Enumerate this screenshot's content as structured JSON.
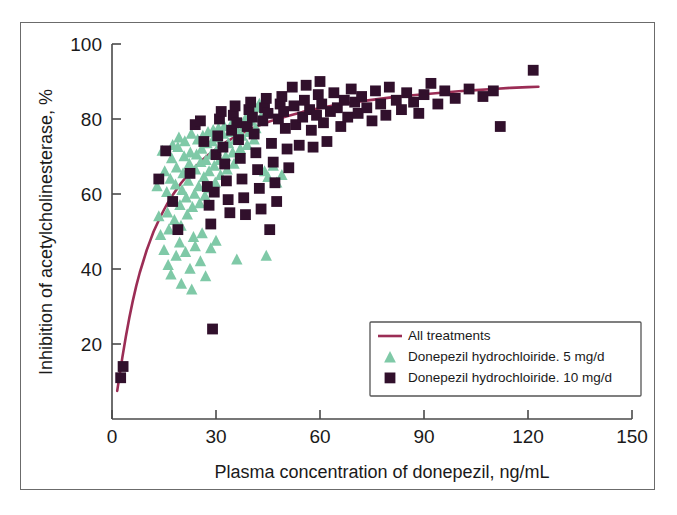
{
  "figure": {
    "background_color": "#ffffff",
    "frame_color": "#6b6b6b"
  },
  "chart_data": {
    "type": "scatter",
    "title": "",
    "subtitle": "",
    "xlabel": "Plasma concentration of donepezil, ng/mL",
    "ylabel": "Inhibition of acetylcholinesterase, %",
    "xlim": [
      0,
      150
    ],
    "ylim": [
      0,
      100
    ],
    "xticks": [
      0,
      30,
      60,
      90,
      120,
      150
    ],
    "yticks": [
      20,
      40,
      60,
      80,
      100
    ],
    "xtick_labels": [
      "0",
      "30",
      "60",
      "90",
      "120",
      "150"
    ],
    "ytick_labels": [
      "20",
      "40",
      "60",
      "80",
      "100"
    ],
    "grid": false,
    "legend_position": "lower-right",
    "legend": [
      {
        "label": "All treatments",
        "marker": "line",
        "color": "#9b2d55"
      },
      {
        "label": "Donepezil hydrochloiride. 5 mg/d",
        "marker": "triangle",
        "color": "#7fc9a7"
      },
      {
        "label": "Donepezil hydrochloiride. 10 mg/d",
        "marker": "square",
        "color": "#31102c"
      }
    ],
    "series": [
      {
        "name": "Donepezil hydrochloiride. 5 mg/d",
        "marker": "triangle",
        "color": "#7fc9a7",
        "points": [
          [
            14.5,
            71.5
          ],
          [
            15.2,
            66.0
          ],
          [
            15.8,
            60.5
          ],
          [
            16.0,
            55.0
          ],
          [
            16.4,
            50.5
          ],
          [
            16.8,
            64.0
          ],
          [
            17.2,
            69.5
          ],
          [
            17.5,
            73.0
          ],
          [
            17.8,
            58.0
          ],
          [
            18.0,
            53.0
          ],
          [
            18.3,
            62.5
          ],
          [
            18.6,
            67.0
          ],
          [
            19.0,
            72.5
          ],
          [
            19.3,
            75.0
          ],
          [
            19.6,
            57.0
          ],
          [
            19.9,
            51.5
          ],
          [
            20.2,
            61.0
          ],
          [
            20.5,
            65.5
          ],
          [
            20.8,
            70.0
          ],
          [
            21.0,
            74.0
          ],
          [
            21.4,
            59.0
          ],
          [
            21.7,
            54.5
          ],
          [
            22.0,
            63.5
          ],
          [
            22.3,
            68.0
          ],
          [
            22.6,
            71.0
          ],
          [
            22.9,
            76.0
          ],
          [
            23.2,
            56.5
          ],
          [
            23.5,
            48.5
          ],
          [
            23.8,
            60.0
          ],
          [
            24.1,
            66.5
          ],
          [
            24.4,
            70.5
          ],
          [
            24.7,
            74.5
          ],
          [
            25.0,
            62.0
          ],
          [
            25.3,
            57.5
          ],
          [
            25.6,
            68.5
          ],
          [
            25.9,
            72.0
          ],
          [
            26.2,
            75.5
          ],
          [
            26.5,
            64.5
          ],
          [
            26.8,
            59.5
          ],
          [
            27.1,
            69.0
          ],
          [
            27.4,
            73.5
          ],
          [
            27.7,
            76.5
          ],
          [
            28.0,
            66.0
          ],
          [
            28.3,
            61.5
          ],
          [
            28.6,
            70.5
          ],
          [
            28.9,
            74.0
          ],
          [
            29.2,
            77.0
          ],
          [
            29.5,
            67.5
          ],
          [
            29.8,
            63.0
          ],
          [
            30.1,
            71.5
          ],
          [
            30.4,
            75.0
          ],
          [
            30.7,
            77.5
          ],
          [
            31.0,
            69.0
          ],
          [
            31.3,
            65.0
          ],
          [
            31.6,
            72.5
          ],
          [
            32.0,
            76.0
          ],
          [
            32.4,
            78.0
          ],
          [
            32.8,
            70.0
          ],
          [
            33.2,
            66.5
          ],
          [
            33.6,
            73.5
          ],
          [
            34.0,
            76.5
          ],
          [
            34.4,
            78.5
          ],
          [
            34.8,
            71.0
          ],
          [
            35.2,
            68.0
          ],
          [
            35.6,
            74.5
          ],
          [
            36.0,
            77.0
          ],
          [
            36.5,
            79.0
          ],
          [
            37.0,
            72.0
          ],
          [
            37.5,
            75.5
          ],
          [
            38.0,
            78.0
          ],
          [
            38.5,
            80.0
          ],
          [
            39.0,
            73.0
          ],
          [
            39.5,
            76.5
          ],
          [
            40.0,
            79.5
          ],
          [
            40.5,
            81.0
          ],
          [
            41.0,
            74.5
          ],
          [
            41.5,
            77.5
          ],
          [
            42.0,
            83.0
          ],
          [
            42.5,
            84.0
          ],
          [
            43.0,
            80.5
          ],
          [
            44.0,
            66.0
          ],
          [
            45.0,
            64.5
          ],
          [
            46.5,
            67.5
          ],
          [
            47.5,
            63.0
          ],
          [
            49.0,
            65.0
          ],
          [
            15.0,
            45.0
          ],
          [
            16.2,
            41.0
          ],
          [
            17.0,
            38.5
          ],
          [
            18.5,
            43.5
          ],
          [
            19.5,
            47.0
          ],
          [
            20.0,
            36.0
          ],
          [
            21.2,
            44.5
          ],
          [
            22.5,
            40.0
          ],
          [
            23.0,
            34.5
          ],
          [
            24.0,
            46.0
          ],
          [
            25.5,
            42.0
          ],
          [
            27.0,
            38.0
          ],
          [
            28.5,
            45.5
          ],
          [
            30.0,
            47.5
          ],
          [
            26.0,
            49.5
          ],
          [
            36.0,
            42.5
          ],
          [
            44.5,
            43.5
          ],
          [
            13.5,
            54.0
          ],
          [
            14.0,
            49.0
          ],
          [
            13.0,
            62.0
          ]
        ]
      },
      {
        "name": "Donepezil hydrochloiride. 10 mg/d",
        "marker": "square",
        "color": "#31102c",
        "points": [
          [
            2.5,
            11.0
          ],
          [
            3.2,
            14.0
          ],
          [
            13.5,
            64.0
          ],
          [
            15.5,
            71.5
          ],
          [
            17.5,
            58.0
          ],
          [
            19.0,
            50.5
          ],
          [
            22.5,
            65.5
          ],
          [
            24.0,
            78.5
          ],
          [
            25.5,
            79.5
          ],
          [
            26.5,
            74.0
          ],
          [
            27.5,
            62.0
          ],
          [
            28.0,
            57.0
          ],
          [
            28.5,
            52.0
          ],
          [
            29.0,
            24.0
          ],
          [
            29.5,
            60.5
          ],
          [
            30.0,
            70.5
          ],
          [
            30.5,
            75.5
          ],
          [
            31.0,
            80.0
          ],
          [
            31.5,
            82.0
          ],
          [
            32.0,
            72.5
          ],
          [
            32.5,
            68.0
          ],
          [
            33.0,
            63.5
          ],
          [
            33.5,
            58.5
          ],
          [
            34.0,
            55.0
          ],
          [
            34.5,
            77.0
          ],
          [
            35.0,
            81.0
          ],
          [
            35.5,
            83.5
          ],
          [
            36.0,
            79.0
          ],
          [
            36.5,
            74.5
          ],
          [
            37.0,
            69.5
          ],
          [
            37.5,
            64.0
          ],
          [
            38.0,
            59.0
          ],
          [
            38.5,
            54.5
          ],
          [
            39.0,
            78.0
          ],
          [
            39.5,
            82.5
          ],
          [
            40.0,
            84.5
          ],
          [
            40.5,
            80.5
          ],
          [
            41.0,
            76.0
          ],
          [
            41.5,
            71.0
          ],
          [
            42.0,
            66.5
          ],
          [
            42.5,
            61.5
          ],
          [
            43.0,
            56.0
          ],
          [
            43.5,
            79.5
          ],
          [
            44.0,
            83.0
          ],
          [
            44.5,
            85.5
          ],
          [
            45.0,
            81.5
          ],
          [
            45.5,
            50.5
          ],
          [
            46.0,
            73.5
          ],
          [
            46.5,
            68.5
          ],
          [
            47.0,
            63.0
          ],
          [
            47.5,
            58.0
          ],
          [
            48.0,
            80.0
          ],
          [
            48.5,
            84.0
          ],
          [
            49.0,
            86.0
          ],
          [
            49.5,
            82.0
          ],
          [
            50.0,
            77.5
          ],
          [
            50.5,
            72.0
          ],
          [
            51.0,
            67.0
          ],
          [
            52.0,
            88.5
          ],
          [
            52.5,
            83.5
          ],
          [
            53.0,
            78.5
          ],
          [
            54.0,
            73.0
          ],
          [
            55.0,
            80.5
          ],
          [
            55.5,
            85.0
          ],
          [
            56.0,
            89.0
          ],
          [
            57.0,
            82.5
          ],
          [
            57.5,
            77.0
          ],
          [
            58.0,
            72.5
          ],
          [
            59.0,
            81.0
          ],
          [
            59.5,
            86.5
          ],
          [
            60.0,
            90.0
          ],
          [
            60.5,
            84.0
          ],
          [
            61.0,
            79.0
          ],
          [
            62.0,
            74.0
          ],
          [
            63.0,
            82.0
          ],
          [
            64.0,
            87.0
          ],
          [
            65.0,
            83.0
          ],
          [
            66.0,
            78.0
          ],
          [
            67.0,
            85.0
          ],
          [
            68.0,
            80.5
          ],
          [
            69.0,
            88.0
          ],
          [
            70.0,
            84.5
          ],
          [
            71.0,
            81.5
          ],
          [
            72.0,
            86.0
          ],
          [
            73.5,
            83.0
          ],
          [
            75.0,
            79.5
          ],
          [
            76.0,
            87.5
          ],
          [
            77.5,
            84.0
          ],
          [
            79.0,
            81.0
          ],
          [
            80.0,
            88.5
          ],
          [
            82.0,
            85.0
          ],
          [
            83.5,
            82.5
          ],
          [
            85.0,
            87.0
          ],
          [
            87.0,
            84.5
          ],
          [
            88.5,
            81.5
          ],
          [
            90.0,
            86.5
          ],
          [
            92.0,
            89.5
          ],
          [
            94.0,
            84.0
          ],
          [
            96.0,
            87.5
          ],
          [
            99.0,
            85.5
          ],
          [
            103.0,
            88.0
          ],
          [
            107.0,
            86.0
          ],
          [
            110.0,
            87.5
          ],
          [
            112.0,
            78.0
          ],
          [
            121.5,
            93.0
          ]
        ]
      }
    ],
    "fit_curve": {
      "name": "All treatments",
      "color": "#9b2d55",
      "description": "Saturating (Emax-type) curve rising steeply from ~8% at 2 ng/mL toward an asymptote of ~88% inhibition",
      "points": [
        [
          1.5,
          7.5
        ],
        [
          2.0,
          10.5
        ],
        [
          2.5,
          13.5
        ],
        [
          3.0,
          16.5
        ],
        [
          4.0,
          22.0
        ],
        [
          5.0,
          27.0
        ],
        [
          6.0,
          31.5
        ],
        [
          7.0,
          35.5
        ],
        [
          8.0,
          39.0
        ],
        [
          9.0,
          42.0
        ],
        [
          10.0,
          45.0
        ],
        [
          11.0,
          47.5
        ],
        [
          12.0,
          50.0
        ],
        [
          13.0,
          52.0
        ],
        [
          14.0,
          54.0
        ],
        [
          15.0,
          55.8
        ],
        [
          16.0,
          57.5
        ],
        [
          17.0,
          59.0
        ],
        [
          18.0,
          60.4
        ],
        [
          19.0,
          61.7
        ],
        [
          20.0,
          63.0
        ],
        [
          22.0,
          65.2
        ],
        [
          24.0,
          67.2
        ],
        [
          26.0,
          69.0
        ],
        [
          28.0,
          70.6
        ],
        [
          30.0,
          72.0
        ],
        [
          33.0,
          73.9
        ],
        [
          36.0,
          75.5
        ],
        [
          39.0,
          76.9
        ],
        [
          42.0,
          78.1
        ],
        [
          45.0,
          79.2
        ],
        [
          48.0,
          80.1
        ],
        [
          51.0,
          80.9
        ],
        [
          55.0,
          81.9
        ],
        [
          60.0,
          82.9
        ],
        [
          65.0,
          83.8
        ],
        [
          70.0,
          84.5
        ],
        [
          75.0,
          85.1
        ],
        [
          80.0,
          85.7
        ],
        [
          85.0,
          86.2
        ],
        [
          90.0,
          86.6
        ],
        [
          95.0,
          87.0
        ],
        [
          100.0,
          87.4
        ],
        [
          105.0,
          87.7
        ],
        [
          110.0,
          88.0
        ],
        [
          115.0,
          88.3
        ],
        [
          120.0,
          88.5
        ],
        [
          123.0,
          88.6
        ]
      ]
    }
  }
}
